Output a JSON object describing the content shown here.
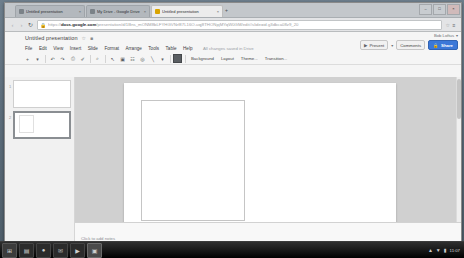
{
  "window": {
    "buttons": {
      "minimize": "–",
      "maximize": "□",
      "close": "×"
    }
  },
  "tabs": {
    "new_tab_label": "+",
    "items": [
      {
        "title": "Untitled presentation",
        "close": "×",
        "active": false,
        "favicon": "doc-favicon"
      },
      {
        "title": "My Drive - Google Drive",
        "close": "×",
        "active": false,
        "favicon": "drive-favicon"
      },
      {
        "title": "Untitled presentation",
        "close": "×",
        "active": true,
        "favicon": "slides-favicon"
      }
    ]
  },
  "navbar": {
    "back": "‹",
    "forward": "›",
    "reload": "↻",
    "home": "⌂",
    "lock_icon": "A",
    "url_prefix": "https://",
    "url_domain": "docs.google.com",
    "url_path": "/presentation/d/1Bns_mONM8bLFYHGVNrf87L16O-uqj8THONpjMYqW0GM/edit#slide=id.g3dbca08z9_20",
    "star": "☆",
    "menu": "≡"
  },
  "doc": {
    "title": "Untitled presentation",
    "star_icon": "☆",
    "folder_icon": "■",
    "menus": [
      "File",
      "Edit",
      "View",
      "Insert",
      "Slide",
      "Format",
      "Arrange",
      "Tools",
      "Table",
      "Help"
    ],
    "save_status": "All changes saved in Drive"
  },
  "account": {
    "label": "Bob Loftus",
    "caret": "▾"
  },
  "actions": {
    "present_icon": "▶",
    "present_label": "Present",
    "present_caret": "▾",
    "comments_label": "Comments",
    "share_icon": "🔒",
    "share_label": "Share"
  },
  "toolbar": {
    "icons": [
      {
        "name": "new-slide-icon",
        "glyph": "+"
      },
      {
        "name": "new-slide-caret-icon",
        "glyph": "▾"
      },
      {
        "name": "undo-icon",
        "glyph": "↶"
      },
      {
        "name": "redo-icon",
        "glyph": "↷"
      },
      {
        "name": "print-icon",
        "glyph": "⎙"
      },
      {
        "name": "paint-format-icon",
        "glyph": "✐"
      },
      {
        "name": "zoom-icon",
        "glyph": "⌕"
      },
      {
        "name": "select-icon",
        "glyph": "↖"
      },
      {
        "name": "textbox-icon",
        "glyph": "▣"
      },
      {
        "name": "insert-image-icon",
        "glyph": "☷"
      },
      {
        "name": "shape-icon",
        "glyph": "◎"
      },
      {
        "name": "line-icon",
        "glyph": "╲"
      },
      {
        "name": "line-caret-icon",
        "glyph": "▾"
      }
    ],
    "fill_color_name": "fill-color-swatch",
    "labels": [
      "Background",
      "Layout",
      "Theme...",
      "Transition..."
    ]
  },
  "filmstrip": {
    "slides": [
      {
        "number": "1",
        "selected": false
      },
      {
        "number": "2",
        "selected": true
      }
    ]
  },
  "notes": {
    "placeholder": "Click to add notes"
  },
  "taskbar": {
    "start_glyph": "⊞",
    "apps": [
      {
        "name": "taskbar-app-explorer",
        "glyph": "▤",
        "active": false
      },
      {
        "name": "taskbar-app-chrome",
        "glyph": "●",
        "active": false
      },
      {
        "name": "taskbar-app-mail",
        "glyph": "✉",
        "active": false
      },
      {
        "name": "taskbar-app-media",
        "glyph": "▶",
        "active": false
      },
      {
        "name": "taskbar-app-docs",
        "glyph": "▣",
        "active": true
      }
    ],
    "tray": {
      "show_hidden": "▲",
      "network": "▼",
      "volume": "▮",
      "clock": "11:07"
    }
  }
}
